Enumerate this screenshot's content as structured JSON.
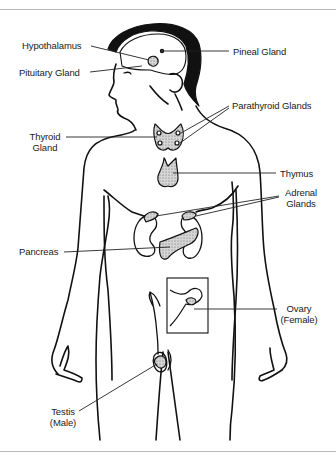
{
  "diagram": {
    "labels": {
      "hypothalamus": "Hypothalamus",
      "pituitary": "Pituitary Gland",
      "pineal": "Pineal Gland",
      "parathyroid": "Parathyroid Glands",
      "thyroid_line1": "Thyroid",
      "thyroid_line2": "Gland",
      "thymus": "Thymus",
      "adrenal_line1": "Adrenal",
      "adrenal_line2": "Glands",
      "pancreas": "Pancreas",
      "ovary_line1": "Ovary",
      "ovary_line2": "(Female)",
      "testis_line1": "Testis",
      "testis_line2": "(Male)"
    },
    "colors": {
      "line": "#111111",
      "gland_fill": "#c8c8c8",
      "rule": "#b9b9b9",
      "background": "#ffffff"
    }
  }
}
